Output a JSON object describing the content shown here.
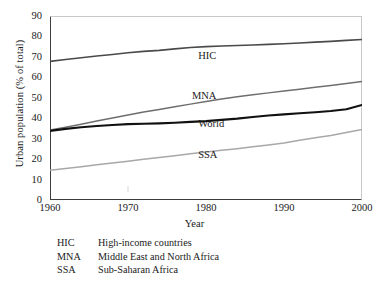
{
  "chart_data": {
    "type": "line",
    "title": "",
    "xlabel": "Year",
    "ylabel": "Urban population (% of total)",
    "xlim": [
      1960,
      2000
    ],
    "ylim": [
      0,
      90
    ],
    "ytick_step": 10,
    "grid": false,
    "xticks": [
      "1960",
      "1970",
      "1980",
      "1990",
      "2000"
    ],
    "yticks": [
      "0",
      "10",
      "20",
      "30",
      "40",
      "50",
      "60",
      "70",
      "80",
      "90"
    ],
    "legend_position": "inline-labels",
    "x": [
      1960,
      1962,
      1964,
      1966,
      1968,
      1970,
      1972,
      1974,
      1976,
      1978,
      1980,
      1982,
      1984,
      1986,
      1988,
      1990,
      1992,
      1994,
      1996,
      1998,
      2000
    ],
    "series": [
      {
        "name": "HIC",
        "color": "#4a4a4a",
        "width": 1.6,
        "label_x": 1979.0,
        "label_y": 70.5,
        "values": [
          67.8,
          68.7,
          69.6,
          70.4,
          71.2,
          72.0,
          72.7,
          73.2,
          73.9,
          74.6,
          75.0,
          75.3,
          75.6,
          75.8,
          76.1,
          76.4,
          76.8,
          77.2,
          77.6,
          78.1,
          78.5
        ]
      },
      {
        "name": "MNA",
        "color": "#6e6e6e",
        "width": 1.5,
        "label_x": 1978.2,
        "label_y": 51.0,
        "values": [
          34.2,
          35.6,
          37.1,
          38.6,
          40.1,
          41.6,
          43.0,
          44.3,
          45.6,
          46.9,
          48.2,
          49.4,
          50.5,
          51.5,
          52.4,
          53.3,
          54.2,
          55.1,
          56.0,
          57.0,
          58.0
        ]
      },
      {
        "name": "World",
        "color": "#111111",
        "width": 2.1,
        "label_x": 1979.0,
        "label_y": 37.0,
        "values": [
          33.8,
          34.8,
          35.6,
          36.2,
          36.7,
          37.1,
          37.3,
          37.5,
          37.8,
          38.2,
          38.6,
          39.2,
          39.8,
          40.6,
          41.3,
          41.9,
          42.4,
          42.9,
          43.5,
          44.4,
          46.5
        ]
      },
      {
        "name": "SSA",
        "color": "#a8a8a8",
        "width": 1.5,
        "label_x": 1979.0,
        "label_y": 22.0,
        "values": [
          14.5,
          15.4,
          16.3,
          17.2,
          18.1,
          19.0,
          19.9,
          20.8,
          21.7,
          22.6,
          23.5,
          24.3,
          25.1,
          26.0,
          26.9,
          27.9,
          29.2,
          30.4,
          31.6,
          33.0,
          34.5
        ]
      }
    ]
  },
  "legend": {
    "rows": [
      {
        "abbr": "HIC",
        "desc": "High-income countries"
      },
      {
        "abbr": "MNA",
        "desc": "Middle East and North Africa"
      },
      {
        "abbr": "SSA",
        "desc": "Sub-Saharan Africa"
      }
    ]
  }
}
